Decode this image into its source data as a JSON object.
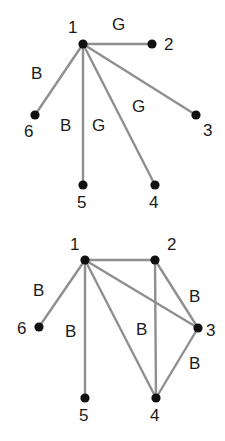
{
  "figure": {
    "background_color": "#ffffff",
    "edge_color": "#8f8f8f",
    "node_color": "#111111",
    "text_color": "#1a1a1a"
  },
  "graphs": [
    {
      "id": "top-graph",
      "name": "star-graph-with-G-and-B-edge-labels",
      "nodes": [
        {
          "id": "1",
          "label": "1",
          "x": 83,
          "y": 44,
          "label_x": 68,
          "label_y": 33
        },
        {
          "id": "2",
          "label": "2",
          "x": 152,
          "y": 44,
          "label_x": 164,
          "label_y": 50
        },
        {
          "id": "3",
          "label": "3",
          "x": 196,
          "y": 115,
          "label_x": 203,
          "label_y": 136
        },
        {
          "id": "4",
          "label": "4",
          "x": 155,
          "y": 185,
          "label_x": 149,
          "label_y": 208
        },
        {
          "id": "5",
          "label": "5",
          "x": 83,
          "y": 185,
          "label_x": 77,
          "label_y": 208
        },
        {
          "id": "6",
          "label": "6",
          "x": 35,
          "y": 115,
          "label_x": 24,
          "label_y": 137
        }
      ],
      "edges": [
        {
          "from": "1",
          "to": "2",
          "label": "G",
          "label_x": 112,
          "label_y": 30
        },
        {
          "from": "1",
          "to": "3",
          "label": "G",
          "label_x": 132,
          "label_y": 112
        },
        {
          "from": "1",
          "to": "4",
          "label": "G",
          "label_x": 92,
          "label_y": 131
        },
        {
          "from": "1",
          "to": "5",
          "label": "B",
          "label_x": 60,
          "label_y": 131
        },
        {
          "from": "1",
          "to": "6",
          "label": "B",
          "label_x": 31,
          "label_y": 79
        }
      ]
    },
    {
      "id": "bottom-graph",
      "name": "graph-with-all-B-edge-labels",
      "nodes": [
        {
          "id": "1",
          "label": "1",
          "x": 85,
          "y": 260,
          "label_x": 70,
          "label_y": 250
        },
        {
          "id": "2",
          "label": "2",
          "x": 155,
          "y": 260,
          "label_x": 167,
          "label_y": 250
        },
        {
          "id": "3",
          "label": "3",
          "x": 198,
          "y": 328,
          "label_x": 206,
          "label_y": 336
        },
        {
          "id": "4",
          "label": "4",
          "x": 156,
          "y": 398,
          "label_x": 150,
          "label_y": 421
        },
        {
          "id": "5",
          "label": "5",
          "x": 85,
          "y": 398,
          "label_x": 79,
          "label_y": 421
        },
        {
          "id": "6",
          "label": "6",
          "x": 39,
          "y": 327,
          "label_x": 17,
          "label_y": 334
        }
      ],
      "edges": [
        {
          "from": "1",
          "to": "2",
          "label": "",
          "label_x": 0,
          "label_y": 0
        },
        {
          "from": "1",
          "to": "6",
          "label": "B",
          "label_x": 33,
          "label_y": 296
        },
        {
          "from": "1",
          "to": "5",
          "label": "B",
          "label_x": 65,
          "label_y": 337
        },
        {
          "from": "1",
          "to": "3",
          "label": "",
          "label_x": 0,
          "label_y": 0
        },
        {
          "from": "1",
          "to": "4",
          "label": "",
          "label_x": 0,
          "label_y": 0
        },
        {
          "from": "2",
          "to": "4",
          "label": "B",
          "label_x": 136,
          "label_y": 335
        },
        {
          "from": "2",
          "to": "3",
          "label": "B",
          "label_x": 189,
          "label_y": 302
        },
        {
          "from": "3",
          "to": "4",
          "label": "B",
          "label_x": 189,
          "label_y": 369
        }
      ]
    }
  ]
}
